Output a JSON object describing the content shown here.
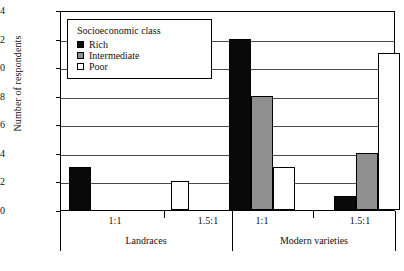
{
  "chart_data": {
    "type": "bar",
    "title": "",
    "xlabel": "",
    "ylabel": "Number of respondents",
    "ylim": [
      0,
      14
    ],
    "ytick_labels": [
      "0",
      "2",
      "4",
      "6",
      "8",
      "10",
      "12",
      "14"
    ],
    "ytick_values": [
      0,
      2,
      4,
      6,
      8,
      10,
      12,
      14
    ],
    "grid": true,
    "legend_title": "Socioeconomic class",
    "legend_position": "upper-left-inside",
    "groups": [
      {
        "label": "Landraces",
        "subgroups": [
          "1:1",
          "1.5:1"
        ]
      },
      {
        "label": "Modern varieties",
        "subgroups": [
          "1:1",
          "1.5:1"
        ]
      }
    ],
    "categories": [
      "Landraces 1:1",
      "Landraces 1.5:1",
      "Modern varieties 1:1",
      "Modern varieties 1.5:1"
    ],
    "series": [
      {
        "name": "Rich",
        "color": "#0a0a0a",
        "values": [
          3,
          0,
          12,
          1
        ]
      },
      {
        "name": "Intermediate",
        "color": "#8f8f8f",
        "values": [
          0,
          0,
          8,
          4
        ]
      },
      {
        "name": "Poor",
        "color": "#ffffff",
        "values": [
          0,
          2,
          3,
          11
        ]
      }
    ]
  },
  "legend": {
    "title": "Socioeconomic class",
    "items": [
      {
        "label": "Rich",
        "swatch": "rich"
      },
      {
        "label": "Intermediate",
        "swatch": "inter"
      },
      {
        "label": "Poor",
        "swatch": "poor"
      }
    ]
  },
  "axes": {
    "y_title": "Number of respondents",
    "y_ticks": [
      "14",
      "12",
      "10",
      "8",
      "6",
      "4",
      "2",
      "0"
    ],
    "x_sublabels": [
      "1:1",
      "1.5:1",
      "1:1",
      "1.5:1"
    ],
    "x_grouplabels": [
      "Landraces",
      "Modern varieties"
    ]
  }
}
